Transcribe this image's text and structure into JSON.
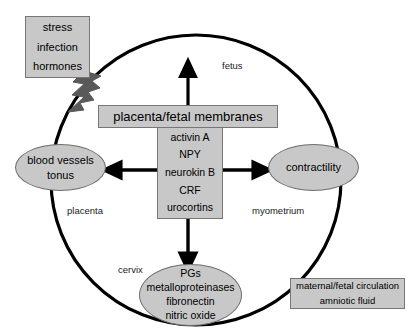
{
  "figure": {
    "type": "diagram",
    "title": "",
    "colors": {
      "box_fill": "#c8c8c8",
      "box_stroke": "#767676",
      "circle_stroke": "#000000",
      "arrow": "#000000",
      "bolt": "#595959",
      "background": "#ffffff"
    }
  },
  "stress_box": {
    "lines": [
      "stress",
      "infection",
      "hormones"
    ],
    "line1": "stress",
    "line2": "infection",
    "line3": "hormones"
  },
  "placenta_bar": {
    "label": "placenta/fetal membranes"
  },
  "mediators": {
    "items": [
      "activin  A",
      "NPY",
      "neurokin  B",
      "CRF",
      "urocortins"
    ],
    "item1": "activin  A",
    "item2": "NPY",
    "item3": "neurokin  B",
    "item4": "CRF",
    "item5": "urocortins"
  },
  "blood_vessels": {
    "line1": "blood vessels",
    "line2": "tonus"
  },
  "contractility": {
    "label": "contractility"
  },
  "pgs": {
    "items": [
      "PGs",
      "metalloproteinases",
      "fibronectin",
      "nitric oxide"
    ],
    "item1": "PGs",
    "item2": "metalloproteinases",
    "item3": "fibronectin",
    "item4": "nitric oxide"
  },
  "circulation_box": {
    "line1": "maternal/fetal circulation",
    "line2": "amniotic fluid"
  },
  "anatomy_labels": {
    "fetus": "fetus",
    "placenta": "placenta",
    "myometrium": "myometrium",
    "cervix": "cervix"
  },
  "arrows": [
    {
      "name": "bolt-arrow",
      "from": "stress/infection/hormones",
      "to": "uterus-wall",
      "style": "lightning"
    },
    {
      "name": "arrow-up-to-fetus",
      "from": "placenta/fetal membranes",
      "to": "fetus",
      "direction": "up"
    },
    {
      "name": "arrow-left-to-blood-vessels",
      "from": "mediators",
      "to": "blood vessels tonus",
      "direction": "left"
    },
    {
      "name": "arrow-right-to-contractility",
      "from": "mediators",
      "to": "contractility",
      "direction": "right"
    },
    {
      "name": "arrow-down-to-pgs",
      "from": "mediators",
      "to": "PGs",
      "direction": "down"
    }
  ]
}
